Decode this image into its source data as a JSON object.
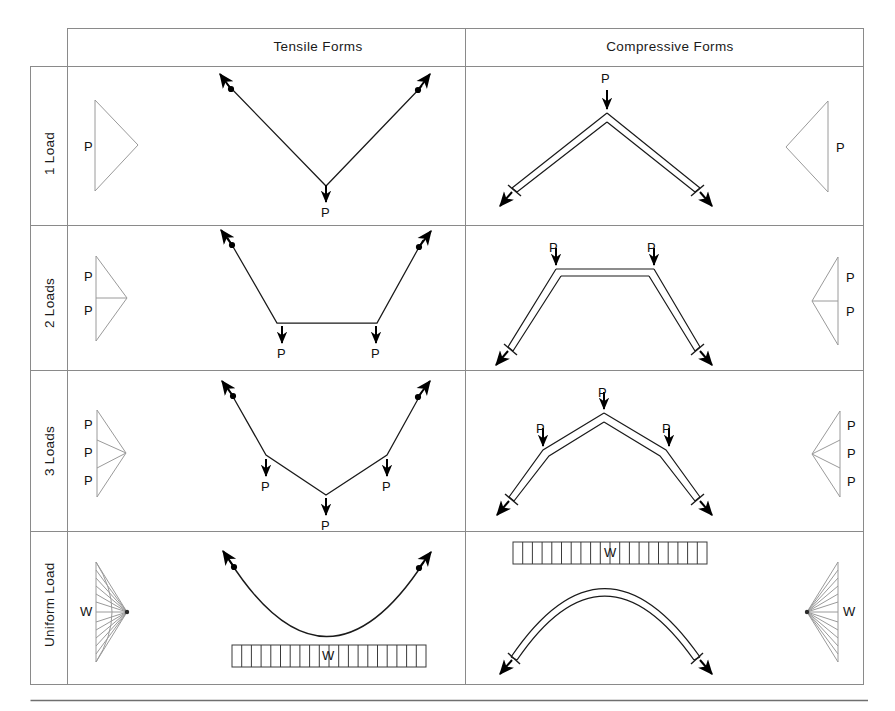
{
  "figure": {
    "title_hidden": "Tensile and Compressive Structural Forms",
    "columns": [
      {
        "id": "row-label",
        "label": ""
      },
      {
        "id": "tensile",
        "label": "Tensile Forms"
      },
      {
        "id": "compressive",
        "label": "Compressive Forms"
      }
    ],
    "rows": [
      {
        "id": "one-load",
        "label": "1 Load"
      },
      {
        "id": "two-loads",
        "label": "2 Loads"
      },
      {
        "id": "three-loads",
        "label": "3 Loads"
      },
      {
        "id": "uniform-load",
        "label": "Uniform Load"
      }
    ],
    "load_symbols": {
      "point": "P",
      "uniform": "W"
    },
    "cells": [
      {
        "row": "one-load",
        "tensile": {
          "key_diagram_loads": [
            "P"
          ],
          "form_loads": [
            "P"
          ],
          "form": "V-shaped cable, single point load at apex, two anchor cables pulling outward-up"
        },
        "compressive": {
          "key_diagram_loads": [
            "P"
          ],
          "form_loads": [
            "P"
          ],
          "form": "Inverted-V arch (gable), single point load at crown, two reactions thrusting outward-down"
        }
      },
      {
        "row": "two-loads",
        "tensile": {
          "key_diagram_loads": [
            "P",
            "P"
          ],
          "form_loads": [
            "P",
            "P"
          ],
          "form": "Trapezoidal cable with flat bottom, two point loads at kinks"
        },
        "compressive": {
          "key_diagram_loads": [
            "P",
            "P"
          ],
          "form_loads": [
            "P",
            "P"
          ],
          "form": "Trapezoidal arch with flat crown, two point loads at kinks"
        }
      },
      {
        "row": "three-loads",
        "tensile": {
          "key_diagram_loads": [
            "P",
            "P",
            "P"
          ],
          "form_loads": [
            "P",
            "P",
            "P"
          ],
          "form": "Funicular polygon cable with three point loads"
        },
        "compressive": {
          "key_diagram_loads": [
            "P",
            "P",
            "P"
          ],
          "form_loads": [
            "P",
            "P",
            "P"
          ],
          "form": "Polygonal arch with three point loads, peak at centre"
        }
      },
      {
        "row": "uniform-load",
        "tensile": {
          "key_diagram_loads": [
            "W"
          ],
          "form_loads": [
            "W"
          ],
          "form": "Parabolic catenary cable under uniform load bar beneath"
        },
        "compressive": {
          "key_diagram_loads": [
            "W"
          ],
          "form_loads": [
            "W"
          ],
          "form": "Parabolic arch under uniform load bar above"
        }
      }
    ],
    "uniform_bar_segments": 20,
    "fan_line_count": 13,
    "colors": {
      "grid": "#8a8a8a",
      "key_diagram": "#9a9a9a",
      "form_line": "#1a1a1a",
      "arrow": "#000000",
      "background": "#ffffff",
      "footer_rule": "#6f6f6f"
    }
  }
}
